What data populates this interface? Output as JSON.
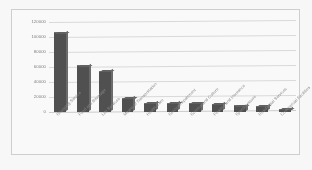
{
  "chart_data": {
    "type": "bar",
    "title": "",
    "xlabel": "",
    "ylabel": "",
    "categories": [
      "Shopping Service",
      "Food and Beverage",
      "Life Services",
      "Means of Transportation",
      "Health Care",
      "Serviced Apartment",
      "Science and Culture",
      "Finance and Insurance",
      "Sports Leisure",
      "Residential Services",
      "Commercial Facilities"
    ],
    "values": [
      105000,
      61000,
      54000,
      18000,
      11000,
      11000,
      10500,
      9500,
      7500,
      7000,
      3000
    ],
    "ylim": [
      0,
      120000
    ],
    "ytick_labels": [
      "0",
      "20000",
      "40000",
      "60000",
      "80000",
      "100000",
      "120000"
    ],
    "ytick_values": [
      0,
      20000,
      40000,
      60000,
      80000,
      100000,
      120000
    ],
    "grid": true,
    "legend": false,
    "legend_position": "none",
    "bar_color": "#4d4d4d",
    "gridline_color": "#dededd",
    "plot_background": "#ffffff",
    "frame_border_color": "#d2d2d2",
    "label_color": "#8a8a8a",
    "style": "3d-column"
  }
}
